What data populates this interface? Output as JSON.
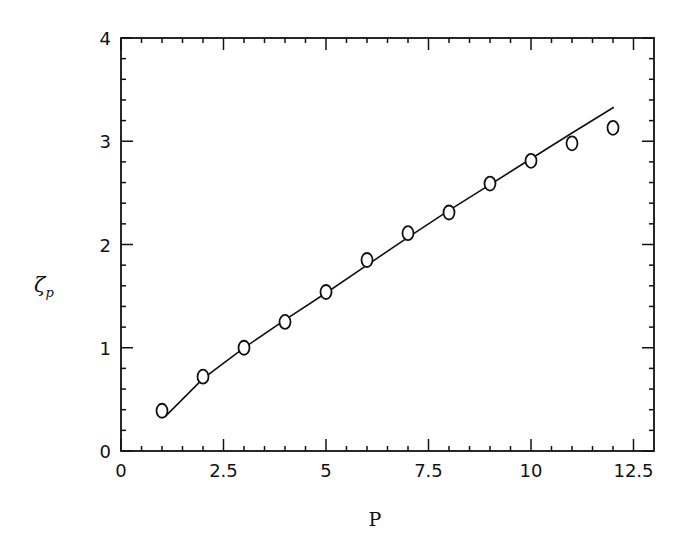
{
  "chart_data": {
    "type": "scatter",
    "title": "",
    "xlabel": "P",
    "ylabel": "ζ",
    "ylabel_subscript": "p",
    "xlim": [
      0,
      13
    ],
    "ylim": [
      0,
      4
    ],
    "x_major_ticks": [
      0,
      2.5,
      5,
      7.5,
      10,
      12.5
    ],
    "x_tick_labels": [
      "0",
      "2.5",
      "5",
      "7.5",
      "10",
      "12.5"
    ],
    "x_minor_step": 0.5,
    "y_major_ticks": [
      0,
      1,
      2,
      3,
      4
    ],
    "y_tick_labels": [
      "0",
      "1",
      "2",
      "3",
      "4"
    ],
    "y_minor_step": 0.2,
    "grid": false,
    "legend": null,
    "series": [
      {
        "name": "data",
        "style": "open-circle",
        "x": [
          1,
          2,
          3,
          4,
          5,
          6,
          7,
          8,
          9,
          10,
          11,
          12
        ],
        "y": [
          0.39,
          0.72,
          1.0,
          1.25,
          1.54,
          1.85,
          2.11,
          2.31,
          2.59,
          2.81,
          2.98,
          3.13
        ]
      },
      {
        "name": "model",
        "style": "solid-line",
        "x": [
          1.07,
          2,
          3,
          4,
          5,
          6,
          7,
          8,
          9,
          10,
          11,
          12.02
        ],
        "y": [
          0.33,
          0.7,
          1.0,
          1.27,
          1.53,
          1.8,
          2.07,
          2.33,
          2.58,
          2.83,
          3.08,
          3.33
        ]
      }
    ]
  }
}
